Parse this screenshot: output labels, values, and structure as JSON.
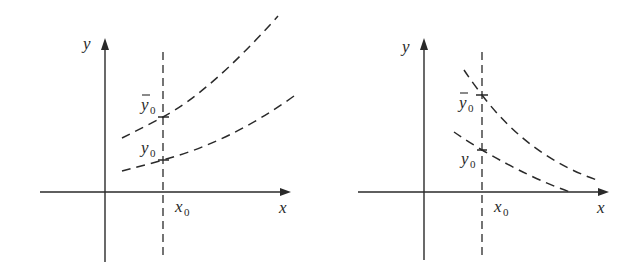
{
  "diagram": {
    "panels": [
      {
        "id": "left",
        "description": "Increasing dashed solution curves; upper curve through (x0, y0-bar), lower through (x0, y0)",
        "labels": {
          "y_axis": "y",
          "x_axis": "x",
          "x0_main": "x",
          "x0_sub": "0",
          "ybar0_main": "y",
          "ybar0_sub": "0",
          "y0_main": "y",
          "y0_sub": "0"
        }
      },
      {
        "id": "right",
        "description": "Decreasing dashed solution curves; upper curve through (x0, y0-bar), lower through (x0, y0)",
        "labels": {
          "y_axis": "y",
          "x_axis": "x",
          "x0_main": "x",
          "x0_sub": "0",
          "ybar0_main": "y",
          "ybar0_sub": "0",
          "y0_main": "y",
          "y0_sub": "0"
        }
      }
    ],
    "colors": {
      "ink": "#2a2a2a",
      "background": "#ffffff"
    }
  }
}
